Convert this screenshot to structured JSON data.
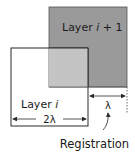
{
  "diagram": {
    "layer_upper": {
      "label_prefix": "Layer ",
      "label_var": "i",
      "label_suffix": " + 1",
      "fill": "#9a9a9a"
    },
    "layer_lower": {
      "label_prefix": "Layer ",
      "label_var": "i",
      "fill": "#ffffff"
    },
    "overlap": {
      "fill": "#c4c4c4"
    },
    "dimension_width": "2λ",
    "dimension_offset": "λ",
    "annotation": "Registration",
    "stroke_color": "#2a2a2a"
  }
}
